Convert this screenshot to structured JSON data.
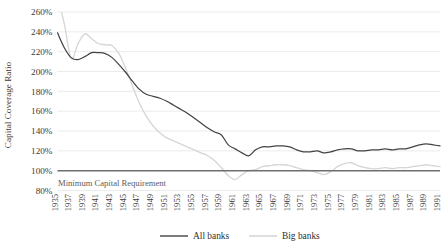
{
  "chart_data": {
    "type": "line",
    "title": "",
    "xlabel": "",
    "ylabel": "Capital Coverage Ratio",
    "ylim": [
      80,
      260
    ],
    "ytick_labels": [
      "260%",
      "240%",
      "220%",
      "200%",
      "180%",
      "160%",
      "140%",
      "120%",
      "100%",
      "80%"
    ],
    "ytick_values": [
      260,
      240,
      220,
      200,
      180,
      160,
      140,
      120,
      100,
      80
    ],
    "grid": true,
    "legend_position": "bottom",
    "xlim": [
      1935,
      1991
    ],
    "x": [
      1935,
      1936,
      1937,
      1938,
      1939,
      1940,
      1941,
      1942,
      1943,
      1944,
      1945,
      1946,
      1947,
      1948,
      1949,
      1950,
      1951,
      1952,
      1953,
      1954,
      1955,
      1956,
      1957,
      1958,
      1959,
      1960,
      1961,
      1962,
      1963,
      1964,
      1965,
      1966,
      1967,
      1968,
      1969,
      1970,
      1971,
      1972,
      1973,
      1974,
      1975,
      1976,
      1977,
      1978,
      1979,
      1980,
      1981,
      1982,
      1983,
      1984,
      1985,
      1986,
      1987,
      1988,
      1989,
      1990,
      1991
    ],
    "xtick_labels": [
      "1935",
      "1937",
      "1939",
      "1941",
      "1943",
      "1945",
      "1947",
      "1949",
      "1951",
      "1953",
      "1955",
      "1957",
      "1959",
      "1961",
      "1963",
      "1965",
      "1967",
      "1969",
      "1971",
      "1973",
      "1975",
      "1977",
      "1979",
      "1981",
      "1983",
      "1985",
      "1987",
      "1989",
      "1991"
    ],
    "series": [
      {
        "name": "All banks",
        "color": "#434343",
        "values": [
          239,
          224,
          214,
          212,
          215,
          219,
          219,
          218,
          214,
          207,
          199,
          190,
          182,
          177,
          175,
          173,
          170,
          166,
          162,
          158,
          153,
          148,
          143,
          139,
          136,
          126,
          122,
          118,
          115,
          121,
          124,
          124,
          125,
          125,
          124,
          121,
          119,
          119,
          120,
          118,
          119,
          121,
          122,
          122,
          120,
          120,
          121,
          121,
          122,
          121,
          122,
          122,
          124,
          126,
          127,
          126,
          125
        ]
      },
      {
        "name": "Big banks",
        "color": "#d6d6d6",
        "values": [
          276,
          248,
          213,
          228,
          238,
          233,
          228,
          227,
          226,
          218,
          203,
          185,
          168,
          155,
          145,
          138,
          133,
          130,
          127,
          124,
          121,
          118,
          115,
          110,
          103,
          95,
          91,
          96,
          100,
          101,
          104,
          105,
          106,
          106,
          105,
          103,
          101,
          100,
          98,
          96,
          99,
          104,
          107,
          108,
          105,
          103,
          102,
          102,
          103,
          102,
          103,
          103,
          104,
          105,
          106,
          105,
          104
        ]
      }
    ],
    "annotations": [
      {
        "name": "minimum-capital-requirement",
        "text": "Minimum Capital Requirement",
        "value": 100
      }
    ]
  },
  "legend": {
    "items": [
      {
        "label": "All banks"
      },
      {
        "label": "Big banks"
      }
    ]
  }
}
